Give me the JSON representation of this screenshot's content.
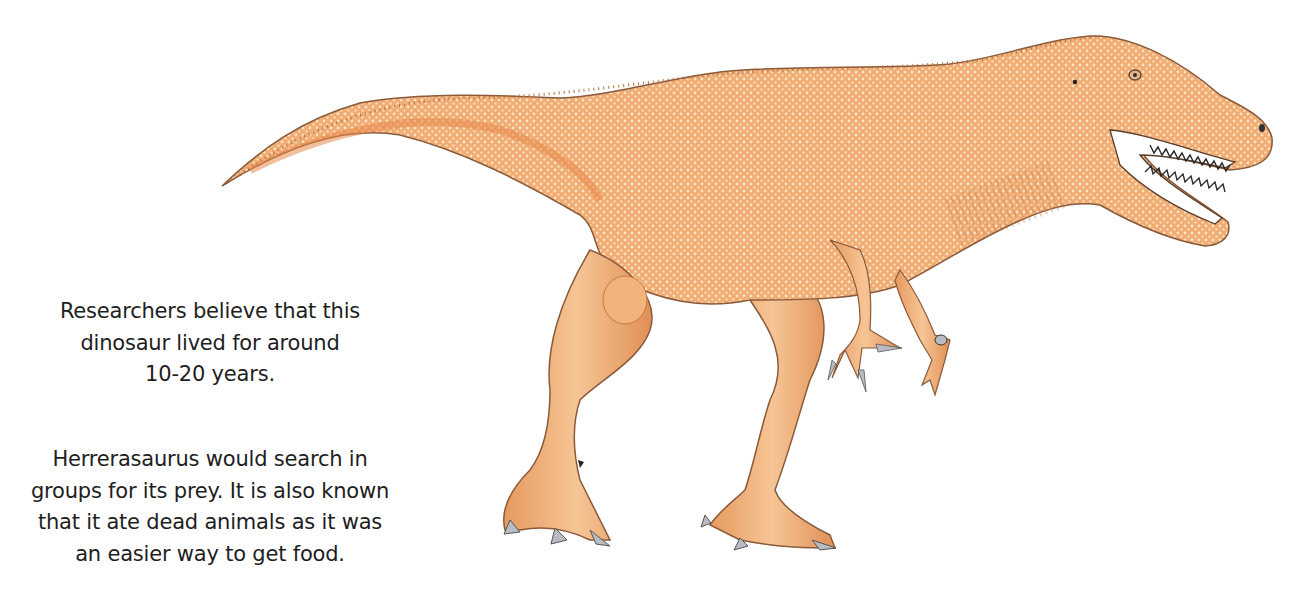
{
  "paragraphs": {
    "lifespan": {
      "lines": [
        "Researchers believe that this",
        "dinosaur lived for around",
        "10-20 years."
      ]
    },
    "behavior": {
      "lines": [
        "Herrerasaurus would search in",
        "groups for its prey. It is also known",
        "that it ate dead animals as it was",
        "an easier way to get food."
      ]
    }
  },
  "illustration": {
    "subject": "Herrerasaurus",
    "description": "Orange theropod dinosaur walking right, open jaws with teeth, raised tail",
    "colors": {
      "body": "#f0ac73",
      "body_light": "#f7c99a",
      "body_shadow": "#d98a4f",
      "outline": "#8a5a3a",
      "claws": "#b8bcc2",
      "teeth": "#2a2a2a",
      "eye": "#6a4a30"
    }
  }
}
